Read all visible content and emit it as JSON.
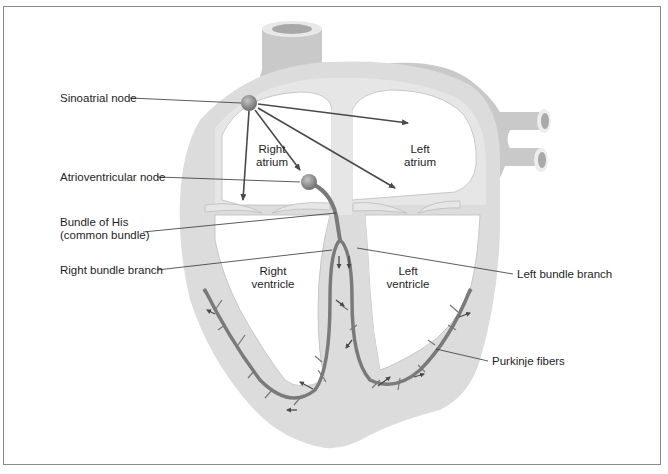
{
  "figure": {
    "colors": {
      "wall": "#dcdcdc",
      "vessel": "#c9c9c9",
      "vessel_lumen": "#a9a9a9",
      "chamber": "#ffffff",
      "conduction_path": "#7a7a7a",
      "node": "#8d8d8d",
      "arrow": "#4a4a4a",
      "leader_line": "#333333",
      "frame": "#8a8a8a"
    }
  },
  "callouts": {
    "sinoatrial_node": "Sinoatrial node",
    "atrioventricular_node": "Atrioventricular node",
    "bundle_of_his_line1": "Bundle of His",
    "bundle_of_his_line2": "(common bundle)",
    "right_bundle_branch": "Right bundle branch",
    "left_bundle_branch": "Left bundle branch",
    "purkinje_fibers": "Purkinje fibers"
  },
  "chambers": {
    "right_atrium_line1": "Right",
    "right_atrium_line2": "atrium",
    "left_atrium_line1": "Left",
    "left_atrium_line2": "atrium",
    "right_ventricle_line1": "Right",
    "right_ventricle_line2": "ventricle",
    "left_ventricle_line1": "Left",
    "left_ventricle_line2": "ventricle"
  }
}
